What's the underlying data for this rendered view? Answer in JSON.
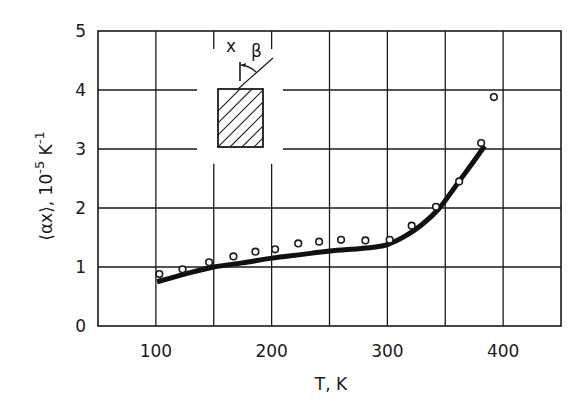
{
  "chart_data": {
    "type": "line",
    "title": "",
    "xlabel": "T, K",
    "ylabel": "⟨αx⟩, 10⁻⁵ K⁻¹",
    "ylabel_parts": {
      "main": "⟨αx⟩, 10",
      "exp": "-5",
      "unit": " K",
      "unit_exp": "-1"
    },
    "xlim": [
      50,
      450
    ],
    "ylim": [
      0,
      5
    ],
    "x_ticks": [
      100,
      200,
      300,
      400
    ],
    "x_gridlines": [
      100,
      150,
      200,
      250,
      300,
      350,
      400
    ],
    "y_ticks": [
      0,
      1,
      2,
      3,
      4,
      5
    ],
    "grid": true,
    "legend": null,
    "series": [
      {
        "name": "experimental points",
        "style": "open-circle markers",
        "x": [
          103,
          123,
          146,
          167,
          186,
          203,
          223,
          241,
          260,
          281,
          302,
          321,
          342,
          362,
          381,
          392
        ],
        "y": [
          0.88,
          0.96,
          1.08,
          1.18,
          1.26,
          1.3,
          1.4,
          1.43,
          1.46,
          1.45,
          1.46,
          1.7,
          2.02,
          2.45,
          3.1,
          3.88
        ]
      },
      {
        "name": "calculated curve",
        "style": "thick solid line",
        "x": [
          101,
          125,
          150,
          175,
          200,
          225,
          250,
          275,
          290,
          300,
          315,
          330,
          345,
          360,
          372,
          384
        ],
        "y": [
          0.75,
          0.88,
          1.0,
          1.07,
          1.15,
          1.21,
          1.27,
          1.31,
          1.34,
          1.38,
          1.52,
          1.72,
          2.0,
          2.4,
          2.72,
          3.05
        ]
      }
    ],
    "annotations": {
      "inset": "hatched rectangular sample with axis x and angle β",
      "inset_labels": [
        "x",
        "β"
      ]
    }
  }
}
